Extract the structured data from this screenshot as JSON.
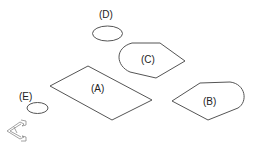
{
  "diagram": {
    "shapes": [
      {
        "id": "A",
        "label": "(A)",
        "kind": "parallelogram"
      },
      {
        "id": "B",
        "label": "(B)",
        "kind": "rounded-pointed-shape"
      },
      {
        "id": "C",
        "label": "(C)",
        "kind": "rounded-pointed-shape"
      },
      {
        "id": "D",
        "label": "(D)",
        "kind": "ellipse"
      },
      {
        "id": "E",
        "label": "(E)",
        "kind": "ellipse"
      }
    ],
    "icon": "isometric-axes-icon",
    "colors": {
      "stroke": "#555555",
      "text": "#222222",
      "background": "#ffffff"
    }
  }
}
